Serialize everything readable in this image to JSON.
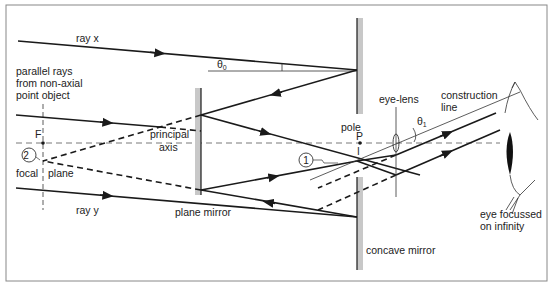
{
  "labels": {
    "ray_x": "ray x",
    "ray_y": "ray y",
    "parallel_rays_line1": "parallel rays",
    "parallel_rays_line2": "from non-axial",
    "parallel_rays_line3": "point object",
    "focal_point": "F",
    "focal_plane_left": "focal",
    "focal_plane_right": "plane",
    "principal_axis_line1": "principal",
    "principal_axis_line2": "axis",
    "theta0": "θ",
    "theta0_sub": "0",
    "theta1": "θ",
    "theta1_sub": "1",
    "pole": "pole",
    "pole_point": "P",
    "image_marker": "I",
    "eye_lens": "eye-lens",
    "construction_line1": "construction",
    "construction_line2": "line",
    "plane_mirror": "plane mirror",
    "concave_mirror": "concave mirror",
    "eye_line1": "eye focussed",
    "eye_line2": "on infinity",
    "image_1": "1",
    "image_2": "2"
  },
  "colors": {
    "ink": "#1a1a1a",
    "mirror_fill": "#c8c8c8",
    "border": "#888888",
    "axis": "#555555"
  }
}
